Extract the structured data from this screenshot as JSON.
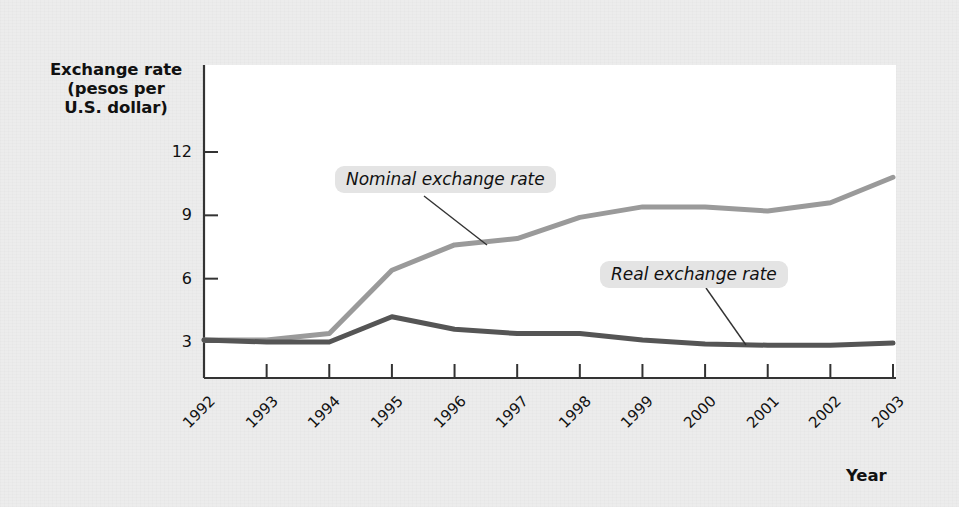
{
  "chart_data": {
    "type": "line",
    "title": "",
    "xlabel": "Year",
    "ylabel": "Exchange rate (pesos per U.S. dollar)",
    "ylabel_lines": [
      "Exchange rate",
      "(pesos per",
      "U.S. dollar)"
    ],
    "grid": false,
    "legend_position": "inline-annotations",
    "categories": [
      "1992",
      "1993",
      "1994",
      "1995",
      "1996",
      "1997",
      "1998",
      "1999",
      "2000",
      "2001",
      "2002",
      "2003"
    ],
    "x": [
      1992,
      1993,
      1994,
      1995,
      1996,
      1997,
      1998,
      1999,
      2000,
      2001,
      2002,
      2003
    ],
    "ylim": [
      0,
      13.5
    ],
    "yticks": [
      3,
      6,
      9,
      12
    ],
    "ytick_labels": [
      "3",
      "6",
      "9",
      "12"
    ],
    "xtick_labels": [
      "1992",
      "1993",
      "1994",
      "1995",
      "1996",
      "1997",
      "1998",
      "1999",
      "2000",
      "2001",
      "2002",
      "2003"
    ],
    "series": [
      {
        "name": "Nominal exchange rate",
        "color": "#9a9a9a",
        "values": [
          3.1,
          3.1,
          3.4,
          6.4,
          7.6,
          7.9,
          8.9,
          9.4,
          9.4,
          9.2,
          9.6,
          10.8
        ]
      },
      {
        "name": "Real exchange rate",
        "color": "#555555",
        "values": [
          3.1,
          3.0,
          3.0,
          4.2,
          3.6,
          3.4,
          3.4,
          3.1,
          2.9,
          2.85,
          2.85,
          2.95
        ]
      }
    ],
    "annotations": [
      {
        "text": "Nominal exchange rate",
        "anchor_year": 1996,
        "anchor_value": 7.6
      },
      {
        "text": "Real exchange rate",
        "anchor_year": 2000,
        "anchor_value": 2.9
      }
    ]
  },
  "colors": {
    "background": "#ececec",
    "panel": "#ffffff",
    "axis": "#333333",
    "nominal": "#9a9a9a",
    "real": "#555555",
    "label_pill": "#e4e4e4",
    "text": "#111111"
  }
}
